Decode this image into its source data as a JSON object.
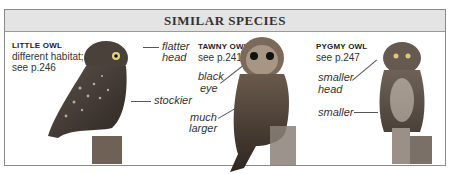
{
  "header": {
    "title": "SIMILAR SPECIES"
  },
  "species": [
    {
      "name": "LITTLE OWL",
      "description_lines": [
        "different habitat;",
        "see p.246"
      ],
      "annotations": [
        {
          "lines": [
            "flatter",
            "head"
          ]
        },
        {
          "lines": [
            "stockier"
          ]
        }
      ]
    },
    {
      "name": "TAWNY OWL",
      "description_lines": [
        "see p.241"
      ],
      "annotations": [
        {
          "lines": [
            "black",
            "eye"
          ]
        },
        {
          "lines": [
            "much",
            "larger"
          ]
        }
      ]
    },
    {
      "name": "PYGMY OWL",
      "description_lines": [
        "see p.247"
      ],
      "annotations": [
        {
          "lines": [
            "smaller",
            "head"
          ]
        },
        {
          "lines": [
            "smaller"
          ]
        }
      ]
    }
  ],
  "colors": {
    "header_bg": "#e4e4e4",
    "border": "#8a8a8a",
    "text": "#333333"
  }
}
